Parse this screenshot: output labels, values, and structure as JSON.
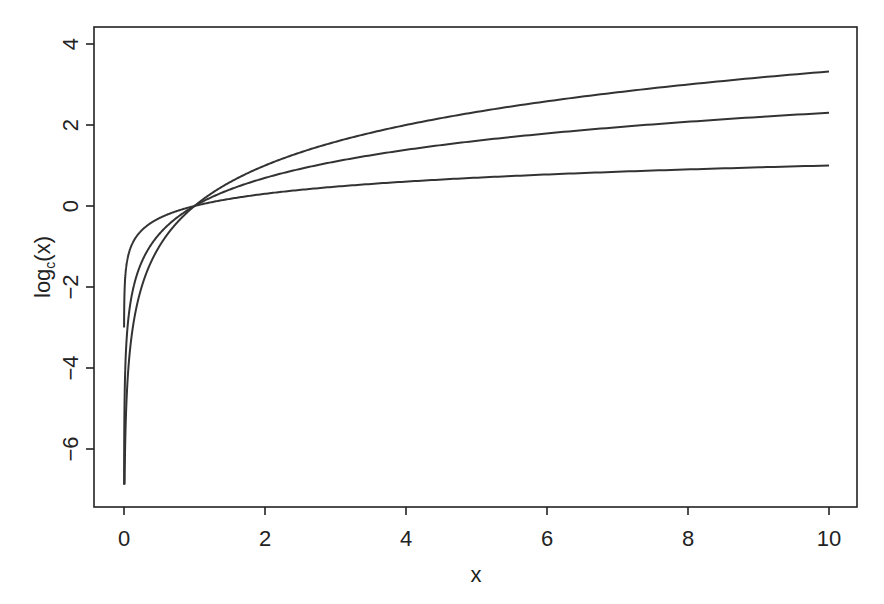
{
  "chart_data": {
    "type": "line",
    "title": "",
    "xlabel": "x",
    "ylabel": "log_c(x)",
    "ylabel_main": "log",
    "ylabel_sub": "c",
    "ylabel_tail": "(x)",
    "xlim": [
      -0.4,
      10.4
    ],
    "ylim": [
      -7.45,
      4.45
    ],
    "x_ticks": [
      0,
      2,
      4,
      6,
      8,
      10
    ],
    "y_ticks": [
      -6,
      -4,
      -2,
      0,
      2,
      4
    ],
    "grid": false,
    "legend": null,
    "series": [
      {
        "name": "log base 2",
        "base": 2,
        "x_start": 0.001,
        "x_end": 10,
        "end_value": 3.32
      },
      {
        "name": "log base e",
        "base": 2.718281828,
        "x_start": 0.001,
        "x_end": 10,
        "end_value": 2.3
      },
      {
        "name": "log base 10",
        "base": 10,
        "x_start": 0.001,
        "x_end": 10,
        "end_value": 1.0
      }
    ]
  }
}
